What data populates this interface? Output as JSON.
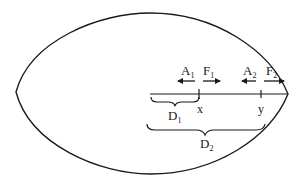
{
  "diagram": {
    "shape": "elongated ellipse (lemon shape) with horizontal axis segment",
    "stroke_color": "#1a1a1a",
    "background": "#ffffff",
    "axis": {
      "start_x_label": "",
      "points": [
        {
          "id": "x",
          "label": "x"
        },
        {
          "id": "y",
          "label": "y"
        }
      ]
    },
    "forces": [
      {
        "id": "A1",
        "base": "A",
        "sub": "1",
        "direction": "left"
      },
      {
        "id": "F1",
        "base": "F",
        "sub": "1",
        "direction": "right"
      },
      {
        "id": "A2",
        "base": "A",
        "sub": "2",
        "direction": "left"
      },
      {
        "id": "F2",
        "base": "F",
        "sub": "2",
        "direction": "right"
      }
    ],
    "braces": [
      {
        "id": "D1",
        "base": "D",
        "sub": "1",
        "spans": "start to x"
      },
      {
        "id": "D2",
        "base": "D",
        "sub": "2",
        "spans": "start to y"
      }
    ]
  }
}
